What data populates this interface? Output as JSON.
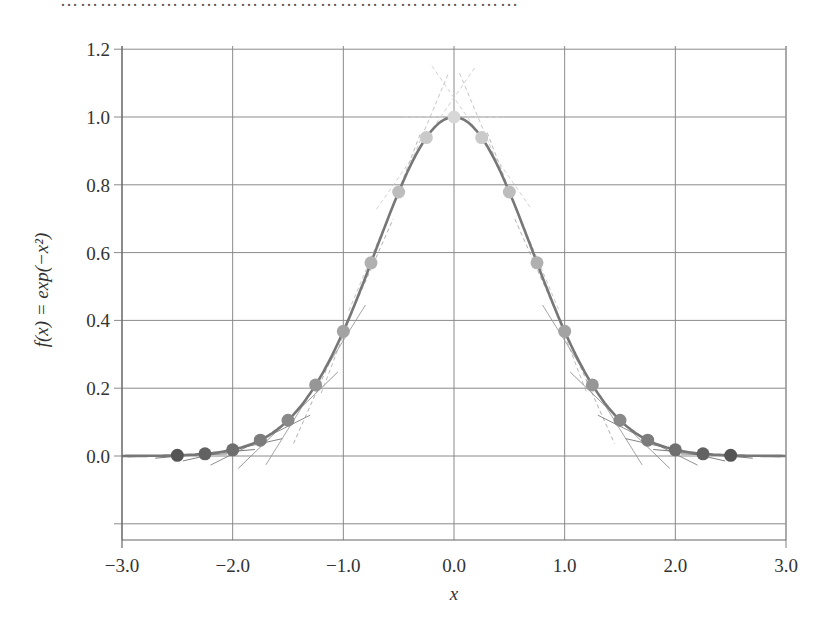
{
  "top_text": "……………………………………………………………",
  "chart_data": {
    "type": "line",
    "title": "",
    "xlabel": "x",
    "ylabel": "f(x) = exp(−x²)",
    "xlim": [
      -3.0,
      3.0
    ],
    "ylim": [
      -0.25,
      1.25
    ],
    "xticks": [
      -3.0,
      -2.0,
      -1.0,
      0.0,
      1.0,
      2.0,
      3.0
    ],
    "xtick_labels": [
      "−3.0",
      "−2.0",
      "−1.0",
      "0.0",
      "1.0",
      "2.0",
      "3.0"
    ],
    "yticks": [
      0.0,
      0.2,
      0.4,
      0.6,
      0.8,
      1.0,
      1.2
    ],
    "ytick_labels": [
      "0.0",
      "0.2",
      "0.4",
      "0.6",
      "0.8",
      "1.0",
      "1.2"
    ],
    "grid": true,
    "legend": null,
    "series": [
      {
        "name": "f(x) = exp(-x^2) curve",
        "kind": "line",
        "color": "#777777"
      },
      {
        "name": "sample points with tangent lines",
        "kind": "scatter",
        "x": [
          -2.5,
          -2.25,
          -2.0,
          -1.75,
          -1.5,
          -1.25,
          -1.0,
          -0.75,
          -0.5,
          -0.25,
          0.0,
          0.25,
          0.5,
          0.75,
          1.0,
          1.25,
          1.5,
          1.75,
          2.0,
          2.25,
          2.5
        ],
        "y": [
          0.002,
          0.006,
          0.018,
          0.047,
          0.105,
          0.21,
          0.368,
          0.57,
          0.779,
          0.939,
          1.0,
          0.939,
          0.779,
          0.57,
          0.368,
          0.21,
          0.105,
          0.047,
          0.018,
          0.006,
          0.002
        ],
        "colormap": "gray: dark at tails, light near peak"
      }
    ],
    "annotations": [
      "tangent line segments drawn at each sample point"
    ]
  },
  "colors": {
    "grid": "#888888",
    "curve": "#777777",
    "dark_point": "#555555",
    "light_point": "#d0d0d0"
  }
}
